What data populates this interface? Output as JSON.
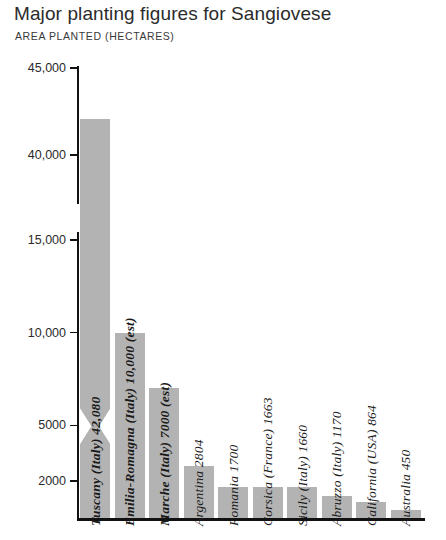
{
  "header": {
    "title": "Major planting figures for Sangiovese",
    "subtitle": "AREA PLANTED (HECTARES)"
  },
  "chart_data": {
    "type": "bar",
    "title": "Major planting figures for Sangiovese",
    "subtitle": "AREA PLANTED (HECTARES)",
    "xlabel": "",
    "ylabel": "AREA PLANTED (HECTARES)",
    "grid": false,
    "legend": false,
    "broken_axis": true,
    "axis_break_between": [
      15000,
      40000
    ],
    "ylim": [
      0,
      45000
    ],
    "ticks": [
      "45,000",
      "40,000",
      "15,000",
      "10,000",
      "5000",
      "2000"
    ],
    "tick_values": [
      45000,
      40000,
      15000,
      10000,
      5000,
      2000
    ],
    "categories": [
      "Tuscany (Italy)",
      "Emilia-Romagna (Italy)",
      "Marche (Italy)",
      "Argentina",
      "Romania",
      "Corsica (France)",
      "Sicily (Italy)",
      "Abruzzo (Italy)",
      "California (USA)",
      "Australia"
    ],
    "values": [
      42080,
      10000,
      7000,
      2804,
      1700,
      1663,
      1660,
      1170,
      864,
      450
    ],
    "bar_labels": [
      "Tuscany (Italy) 42,080",
      "Emilia-Romagna (Italy) 10,000 (est)",
      "Marche (Italy) 7000 (est)",
      "Argentina 2804",
      "Romania 1700",
      "Corsica (France) 1663",
      "Sicily (Italy) 1660",
      "Abruzzo (Italy) 1170",
      "California (USA) 864",
      "Australia 450"
    ],
    "estimated": [
      false,
      true,
      true,
      false,
      false,
      false,
      false,
      false,
      false,
      false
    ],
    "colors": {
      "bar": "#b3b3b3",
      "axis": "#111111",
      "text": "#231f20",
      "background": "#ffffff"
    }
  }
}
